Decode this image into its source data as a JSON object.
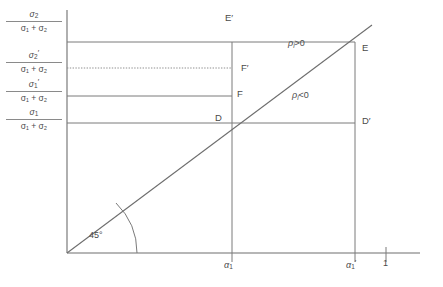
{
  "figure": {
    "type": "line-diagram"
  },
  "axes": {
    "x_ticks": [
      {
        "id": "alpha1",
        "label_main": "α",
        "label_sub": "1",
        "label_prime": "",
        "x": 232
      },
      {
        "id": "alpha1prime",
        "label_main": "α",
        "label_sub": "1",
        "label_prime": "′",
        "x": 355
      },
      {
        "id": "one",
        "label_main": "1",
        "label_sub": "",
        "label_prime": "",
        "x": 386
      }
    ],
    "y_ticks": [
      {
        "id": "sigma2_ratio",
        "num_main": "σ",
        "num_sub": "2",
        "num_prime": "",
        "den": "σ₁ + σ₂",
        "y": 42,
        "line": "solid"
      },
      {
        "id": "sigma2prime_ratio",
        "num_main": "σ",
        "num_sub": "2",
        "num_prime": "′",
        "den": "σ₁ + σ₂",
        "y": 68,
        "line": "dotted"
      },
      {
        "id": "sigma1prime_ratio",
        "num_main": "σ",
        "num_sub": "1",
        "num_prime": "′",
        "den": "σ₁ + σ₂",
        "y": 96,
        "line": "solid"
      },
      {
        "id": "sigma1_ratio",
        "num_main": "σ",
        "num_sub": "1",
        "num_prime": "",
        "den": "σ₁ + σ₂",
        "y": 123,
        "line": "solid"
      }
    ]
  },
  "points": {
    "E_prime": "E′",
    "E": "E",
    "F_prime": "F′",
    "F": "F",
    "D": "D",
    "D_prime": "D′"
  },
  "annotations": {
    "rho_positive": "ρ",
    "rho_positive_sub": "i",
    "rho_positive_rel": ">0",
    "rho_negative": "ρ",
    "rho_negative_sub": "i",
    "rho_negative_rel": "<0",
    "angle": "45°"
  },
  "colors": {
    "line": "#7a7a7a",
    "axis": "#6e6e6e",
    "text": "#4a4a4a",
    "background": "#ffffff"
  }
}
